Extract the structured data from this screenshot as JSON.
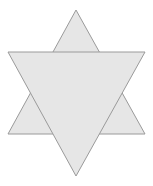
{
  "figure": {
    "name": "star-of-david",
    "canvas": {
      "width": 153,
      "height": 186,
      "background_color": "#ffffff"
    },
    "style": {
      "fill_color": "#e6e6e6",
      "fill_opacity": 1,
      "stroke_color": "#9a9a9a",
      "stroke_width": 1,
      "shadow_edge_color": "#c9c9c9"
    },
    "shapes": [
      {
        "name": "upward-triangle",
        "orientation": "up",
        "points": "76,10 145,134 8,134",
        "vertices": [
          {
            "label": "apex-top",
            "x": 76,
            "y": 10
          },
          {
            "label": "base-right",
            "x": 145,
            "y": 134
          },
          {
            "label": "base-left",
            "x": 8,
            "y": 134
          }
        ]
      },
      {
        "name": "downward-triangle",
        "orientation": "down",
        "points": "76,176 8,52 145,52",
        "vertices": [
          {
            "label": "apex-bottom",
            "x": 76,
            "y": 176
          },
          {
            "label": "base-left",
            "x": 8,
            "y": 52
          },
          {
            "label": "base-right",
            "x": 145,
            "y": 52
          }
        ]
      }
    ],
    "inner_hexagon": {
      "name": "central-hexagon",
      "points": "53.2,52 98.8,52 121.6,93 98.8,134 53.2,134 30.4,93"
    }
  }
}
